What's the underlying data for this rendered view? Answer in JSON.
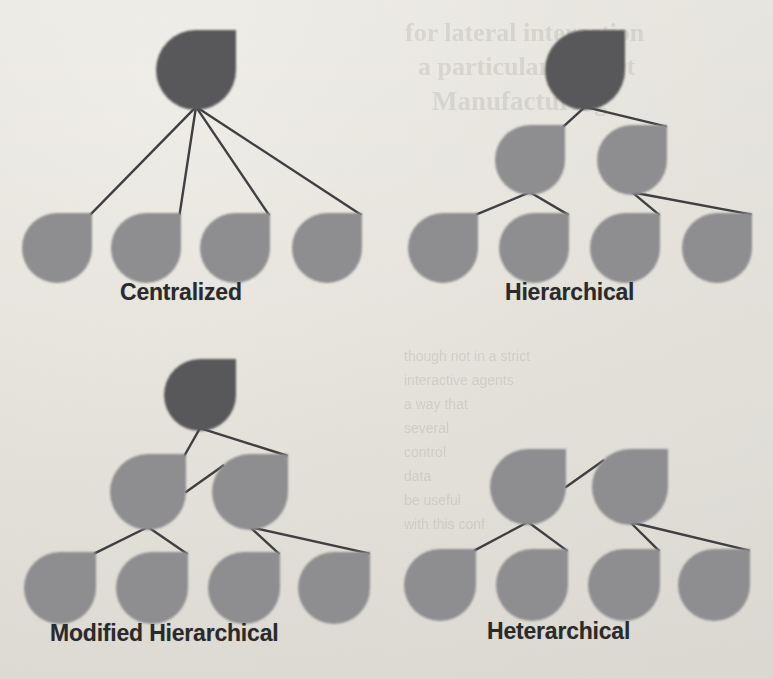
{
  "figure": {
    "background_color": "#f2f1ed",
    "node_dark_color": "#58585a",
    "node_light_color": "#8e8e90",
    "edge_color": "#3f3f42",
    "divider_color": "#6e6e70",
    "label_color": "#2a2a2a"
  },
  "dividers": {
    "horizontal": {
      "x1": 20,
      "y1": 329,
      "x2": 758,
      "y2": 329
    },
    "vertical": {
      "x1": 390,
      "y1": 25,
      "x2": 390,
      "y2": 656
    }
  },
  "quadrants": [
    {
      "id": "centralized",
      "label": "Centralized",
      "position": "top-left",
      "node_count": 5,
      "dark_nodes": 1,
      "light_nodes": 4,
      "levels": 2,
      "nodes": [
        {
          "id": "c-root",
          "tone": "dark",
          "cx": 196,
          "cy": 70,
          "r": 40
        },
        {
          "id": "c-l1",
          "tone": "light",
          "cx": 57,
          "cy": 248,
          "r": 35
        },
        {
          "id": "c-l2",
          "tone": "light",
          "cx": 146,
          "cy": 248,
          "r": 35
        },
        {
          "id": "c-l3",
          "tone": "light",
          "cx": 235,
          "cy": 248,
          "r": 35
        },
        {
          "id": "c-l4",
          "tone": "light",
          "cx": 327,
          "cy": 248,
          "r": 35
        }
      ],
      "edges": [
        {
          "from": "c-root",
          "to": "c-l1"
        },
        {
          "from": "c-root",
          "to": "c-l2"
        },
        {
          "from": "c-root",
          "to": "c-l3"
        },
        {
          "from": "c-root",
          "to": "c-l4"
        }
      ]
    },
    {
      "id": "hierarchical",
      "label": "Hierarchical",
      "position": "top-right",
      "node_count": 7,
      "dark_nodes": 1,
      "light_nodes": 6,
      "levels": 3,
      "nodes": [
        {
          "id": "h-root",
          "tone": "dark",
          "cx": 585,
          "cy": 70,
          "r": 40
        },
        {
          "id": "h-m1",
          "tone": "light",
          "cx": 530,
          "cy": 160,
          "r": 35
        },
        {
          "id": "h-m2",
          "tone": "light",
          "cx": 632,
          "cy": 160,
          "r": 35
        },
        {
          "id": "h-l1",
          "tone": "light",
          "cx": 443,
          "cy": 248,
          "r": 35
        },
        {
          "id": "h-l2",
          "tone": "light",
          "cx": 534,
          "cy": 248,
          "r": 35
        },
        {
          "id": "h-l3",
          "tone": "light",
          "cx": 625,
          "cy": 248,
          "r": 35
        },
        {
          "id": "h-l4",
          "tone": "light",
          "cx": 717,
          "cy": 248,
          "r": 35
        }
      ],
      "edges": [
        {
          "from": "h-root",
          "to": "h-m1"
        },
        {
          "from": "h-root",
          "to": "h-m2"
        },
        {
          "from": "h-m1",
          "to": "h-l1"
        },
        {
          "from": "h-m1",
          "to": "h-l2"
        },
        {
          "from": "h-m2",
          "to": "h-l3"
        },
        {
          "from": "h-m2",
          "to": "h-l4"
        }
      ]
    },
    {
      "id": "modified-hierarchical",
      "label": "Modified Hierarchical",
      "position": "bottom-left",
      "node_count": 7,
      "dark_nodes": 1,
      "light_nodes": 6,
      "levels": 3,
      "has_peer_link": true,
      "nodes": [
        {
          "id": "m-root",
          "tone": "dark",
          "cx": 200,
          "cy": 395,
          "r": 36
        },
        {
          "id": "m-m1",
          "tone": "light",
          "cx": 148,
          "cy": 492,
          "r": 38
        },
        {
          "id": "m-m2",
          "tone": "light",
          "cx": 250,
          "cy": 492,
          "r": 38
        },
        {
          "id": "m-l1",
          "tone": "light",
          "cx": 60,
          "cy": 588,
          "r": 36
        },
        {
          "id": "m-l2",
          "tone": "light",
          "cx": 152,
          "cy": 588,
          "r": 36
        },
        {
          "id": "m-l3",
          "tone": "light",
          "cx": 244,
          "cy": 588,
          "r": 36
        },
        {
          "id": "m-l4",
          "tone": "light",
          "cx": 334,
          "cy": 588,
          "r": 36
        }
      ],
      "edges": [
        {
          "from": "m-root",
          "to": "m-m1"
        },
        {
          "from": "m-root",
          "to": "m-m2"
        },
        {
          "from": "m-m1",
          "to": "m-m2",
          "type": "peer"
        },
        {
          "from": "m-m1",
          "to": "m-l1"
        },
        {
          "from": "m-m1",
          "to": "m-l2"
        },
        {
          "from": "m-m2",
          "to": "m-l3"
        },
        {
          "from": "m-m2",
          "to": "m-l4"
        }
      ]
    },
    {
      "id": "heterarchical",
      "label": "Heterarchical",
      "position": "bottom-right",
      "node_count": 6,
      "dark_nodes": 0,
      "light_nodes": 6,
      "levels": 2,
      "has_peer_link": true,
      "nodes": [
        {
          "id": "x-m1",
          "tone": "light",
          "cx": 528,
          "cy": 487,
          "r": 38
        },
        {
          "id": "x-m2",
          "tone": "light",
          "cx": 630,
          "cy": 487,
          "r": 38
        },
        {
          "id": "x-l1",
          "tone": "light",
          "cx": 440,
          "cy": 585,
          "r": 36
        },
        {
          "id": "x-l2",
          "tone": "light",
          "cx": 532,
          "cy": 585,
          "r": 36
        },
        {
          "id": "x-l3",
          "tone": "light",
          "cx": 624,
          "cy": 585,
          "r": 36
        },
        {
          "id": "x-l4",
          "tone": "light",
          "cx": 714,
          "cy": 585,
          "r": 36
        }
      ],
      "edges": [
        {
          "from": "x-m1",
          "to": "x-m2",
          "type": "peer"
        },
        {
          "from": "x-m1",
          "to": "x-l1"
        },
        {
          "from": "x-m1",
          "to": "x-l2"
        },
        {
          "from": "x-m2",
          "to": "x-l3"
        },
        {
          "from": "x-m2",
          "to": "x-l4"
        }
      ]
    }
  ],
  "bleed_text": [
    {
      "text": "for lateral interaction",
      "x": 405,
      "y": 18,
      "size": 26
    },
    {
      "text": "a particular project",
      "x": 418,
      "y": 52,
      "size": 26
    },
    {
      "text": "Manufacturing",
      "x": 432,
      "y": 86,
      "size": 27
    },
    {
      "text": "though not in a strict",
      "x": 404,
      "y": 348,
      "size": 14
    },
    {
      "text": "interactive agents",
      "x": 404,
      "y": 372,
      "size": 14
    },
    {
      "text": "a way that",
      "x": 404,
      "y": 396,
      "size": 14
    },
    {
      "text": "several",
      "x": 404,
      "y": 420,
      "size": 14
    },
    {
      "text": "control",
      "x": 404,
      "y": 444,
      "size": 14
    },
    {
      "text": "data",
      "x": 404,
      "y": 468,
      "size": 14
    },
    {
      "text": "be useful",
      "x": 404,
      "y": 492,
      "size": 14
    },
    {
      "text": "with this conf",
      "x": 404,
      "y": 516,
      "size": 14
    }
  ]
}
